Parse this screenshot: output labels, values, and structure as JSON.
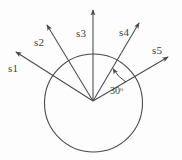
{
  "figure": {
    "background_color": "#fdfdfd",
    "stroke_color": "#4a4a4a",
    "text_color": "#3d3d3d"
  },
  "circle": {
    "name": "reference-circle",
    "cx": 93.5,
    "cy": 103,
    "r": 49,
    "stroke_width": 1.1
  },
  "origin": {
    "x": 93,
    "y": 101
  },
  "vectors": [
    {
      "id": "s1",
      "label": "s1",
      "tip_x": 16,
      "tip_y": 52,
      "angle_deg": 152,
      "label_x": 8,
      "label_y": 72
    },
    {
      "id": "s2",
      "label": "s2",
      "tip_x": 47,
      "tip_y": 25,
      "angle_deg": 124,
      "label_x": 34,
      "label_y": 46
    },
    {
      "id": "s3",
      "label": "s3",
      "tip_x": 93,
      "tip_y": 10,
      "angle_deg": 90,
      "label_x": 76,
      "label_y": 37
    },
    {
      "id": "s4",
      "label": "s4",
      "tip_x": 139,
      "tip_y": 23,
      "angle_deg": 58,
      "label_x": 119,
      "label_y": 36
    },
    {
      "id": "s5",
      "label": "s5",
      "tip_x": 168,
      "tip_y": 57,
      "angle_deg": 30,
      "label_x": 152,
      "label_y": 54
    }
  ],
  "angle_annotation": {
    "name": "angle-30-degrees",
    "value": "30",
    "degree_symbol": "o",
    "full_text": "30o",
    "label_x": 110,
    "label_y": 94,
    "arc_radius": 38,
    "arc_start_deg": 30,
    "arc_end_deg": 58
  },
  "chart_data": {
    "type": "scatter",
    "xlabel": "",
    "ylabel": "",
    "series": [
      {
        "name": "vectors",
        "points": [
          {
            "label": "s1",
            "angle_deg": 152,
            "length_px": 92
          },
          {
            "label": "s2",
            "angle_deg": 124,
            "length_px": 85
          },
          {
            "label": "s3",
            "angle_deg": 90,
            "length_px": 91
          },
          {
            "label": "s4",
            "angle_deg": 58,
            "length_px": 90
          },
          {
            "label": "s5",
            "angle_deg": 30,
            "length_px": 87
          }
        ]
      }
    ],
    "annotations": [
      {
        "text": "30o",
        "between": [
          "s4",
          "s5"
        ],
        "value": 30,
        "unit": "degrees"
      }
    ],
    "grid": false,
    "legend": "none"
  }
}
